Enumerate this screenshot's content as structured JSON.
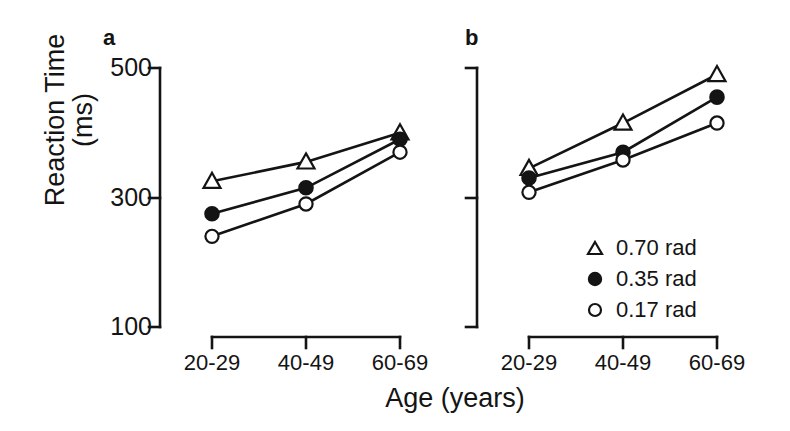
{
  "figure": {
    "xlabel": "Age (years)",
    "ylabel_line1": "Reaction Time",
    "ylabel_line2": "(ms)",
    "panel_a_letter": "a",
    "panel_b_letter": "b",
    "ink_color": "#141414",
    "background_color": "#ffffff"
  },
  "legend": {
    "position": "inside-right-panel-b",
    "entries": [
      {
        "marker": "open-triangle-icon",
        "label": "0.70 rad"
      },
      {
        "marker": "filled-circle-icon",
        "label": "0.35 rad"
      },
      {
        "marker": "open-circle-icon",
        "label": "0.17 rad"
      }
    ]
  },
  "yaxis": {
    "ticks": [
      "500",
      "300",
      "100"
    ],
    "tick_values": [
      500,
      300,
      100
    ],
    "range": [
      100,
      500
    ],
    "title": "Reaction Time (ms)"
  },
  "xaxis": {
    "ticks": [
      "20-29",
      "40-49",
      "60-69"
    ],
    "title": "Age (years)"
  },
  "chart_data": [
    {
      "type": "line",
      "panel": "a",
      "title": "a",
      "xlabel": "Age (years)",
      "ylabel": "Reaction Time (ms)",
      "categories": [
        "20-29",
        "40-49",
        "60-69"
      ],
      "ylim": [
        100,
        500
      ],
      "yticks": [
        100,
        300,
        500
      ],
      "grid": false,
      "legend_position": "panel-b",
      "series": [
        {
          "name": "0.70 rad",
          "marker": "open-triangle",
          "values": [
            325,
            355,
            400
          ]
        },
        {
          "name": "0.35 rad",
          "marker": "filled-circle",
          "values": [
            275,
            315,
            390
          ]
        },
        {
          "name": "0.17 rad",
          "marker": "open-circle",
          "values": [
            240,
            290,
            370
          ]
        }
      ]
    },
    {
      "type": "line",
      "panel": "b",
      "title": "b",
      "xlabel": "Age (years)",
      "ylabel": "Reaction Time (ms)",
      "categories": [
        "20-29",
        "40-49",
        "60-69"
      ],
      "ylim": [
        100,
        500
      ],
      "yticks": [
        100,
        300,
        500
      ],
      "grid": false,
      "legend_position": "inside",
      "series": [
        {
          "name": "0.70 rad",
          "marker": "open-triangle",
          "values": [
            345,
            415,
            490
          ]
        },
        {
          "name": "0.35 rad",
          "marker": "filled-circle",
          "values": [
            330,
            370,
            455
          ]
        },
        {
          "name": "0.17 rad",
          "marker": "open-circle",
          "values": [
            308,
            358,
            415
          ]
        }
      ]
    }
  ]
}
